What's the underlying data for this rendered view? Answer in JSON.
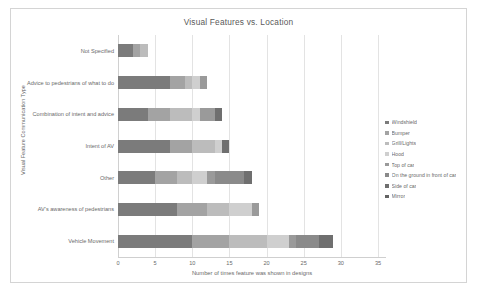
{
  "chart_data": {
    "type": "bar",
    "orientation": "horizontal",
    "stacked": true,
    "title": "Visual Features vs. Location",
    "xlabel": "Number of times feature was shown in designs",
    "ylabel": "Visual Feature Communication Type",
    "xlim": [
      0,
      35
    ],
    "xticks": [
      0,
      5,
      10,
      15,
      20,
      25,
      30,
      35
    ],
    "grid": true,
    "legend_position": "right",
    "categories": [
      "Not Specified",
      "Advice to pedestrians of what to do",
      "Combination of intent and advice",
      "Intent of AV",
      "Other",
      "AV's awareness of pedestrians",
      "Vehicle Movement"
    ],
    "series": [
      {
        "name": "Windshield",
        "color": "#7b7b7b",
        "values": [
          2,
          7,
          4,
          7,
          5,
          8,
          10
        ]
      },
      {
        "name": "Bumper",
        "color": "#a3a3a3",
        "values": [
          1,
          2,
          3,
          3,
          3,
          4,
          5
        ]
      },
      {
        "name": "Grill/Lights",
        "color": "#bcbcbc",
        "values": [
          1,
          1,
          3,
          3,
          2,
          3,
          5
        ]
      },
      {
        "name": "Hood",
        "color": "#cfcfcf",
        "values": [
          0,
          1,
          1,
          1,
          2,
          3,
          3
        ]
      },
      {
        "name": "Top of car",
        "color": "#9a9a9a",
        "values": [
          0,
          1,
          2,
          0,
          1,
          1,
          1
        ]
      },
      {
        "name": "On the ground in front of car",
        "color": "#8a8a8a",
        "values": [
          0,
          0,
          0,
          0,
          4,
          0,
          3
        ]
      },
      {
        "name": "Side of car",
        "color": "#6f6f6f",
        "values": [
          0,
          0,
          1,
          1,
          1,
          0,
          2
        ]
      },
      {
        "name": "Mirror",
        "color": "#636363",
        "values": [
          0,
          0,
          0,
          0,
          0,
          0,
          0
        ]
      }
    ]
  },
  "legend": {
    "items": [
      "Windshield",
      "Bumper",
      "Grill/Lights",
      "Hood",
      "Top of car",
      "On the ground in front of car",
      "Side of car",
      "Mirror"
    ]
  }
}
